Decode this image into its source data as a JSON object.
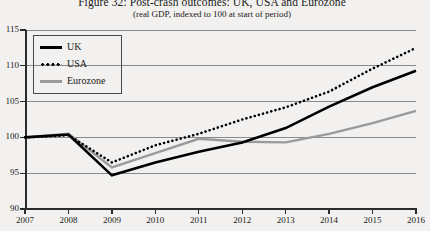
{
  "figure": {
    "title": "Figure 32: Post-crash outcomes: UK, USA and Eurozone",
    "subtitle": "(real GDP, indexed to 100 at start of period)"
  },
  "legend": {
    "items": [
      {
        "label": "UK",
        "style": "solid-thick",
        "color": "#000000"
      },
      {
        "label": "USA",
        "style": "dotted",
        "color": "#000000"
      },
      {
        "label": "Eurozone",
        "style": "solid",
        "color": "#9a9a9a"
      }
    ]
  },
  "axes": {
    "y_ticks": [
      "115",
      "110",
      "105",
      "100",
      "95",
      "90"
    ],
    "x_ticks": [
      "2007",
      "2008",
      "2009",
      "2010",
      "2011",
      "2012",
      "2013",
      "2014",
      "2015",
      "2016"
    ]
  },
  "chart_data": {
    "type": "line",
    "title": "Figure 32: Post-crash outcomes: UK, USA and Eurozone",
    "subtitle": "(real GDP, indexed to 100 at start of period)",
    "xlabel": "",
    "ylabel": "",
    "x": [
      2007,
      2008,
      2009,
      2010,
      2011,
      2012,
      2013,
      2014,
      2015,
      2016
    ],
    "categories": [
      "2007",
      "2008",
      "2009",
      "2010",
      "2011",
      "2012",
      "2013",
      "2014",
      "2015",
      "2016"
    ],
    "xlim": [
      2007,
      2016
    ],
    "ylim": [
      90,
      115
    ],
    "ytick_values": [
      90,
      95,
      100,
      105,
      110,
      115
    ],
    "grid": "horizontal",
    "legend_position": "upper-left-inside",
    "series": [
      {
        "name": "UK",
        "color": "#000000",
        "style": "solid-thick",
        "values": [
          100.0,
          100.4,
          94.7,
          96.5,
          98.0,
          99.3,
          101.3,
          104.3,
          107.0,
          109.3
        ]
      },
      {
        "name": "USA",
        "color": "#000000",
        "style": "dotted",
        "values": [
          100.0,
          100.3,
          96.5,
          98.9,
          100.5,
          102.5,
          104.2,
          106.4,
          109.6,
          112.5
        ]
      },
      {
        "name": "Eurozone",
        "color": "#9a9a9a",
        "style": "solid",
        "values": [
          100.0,
          100.5,
          95.8,
          97.8,
          99.8,
          99.4,
          99.3,
          100.5,
          102.0,
          103.7
        ]
      }
    ]
  }
}
